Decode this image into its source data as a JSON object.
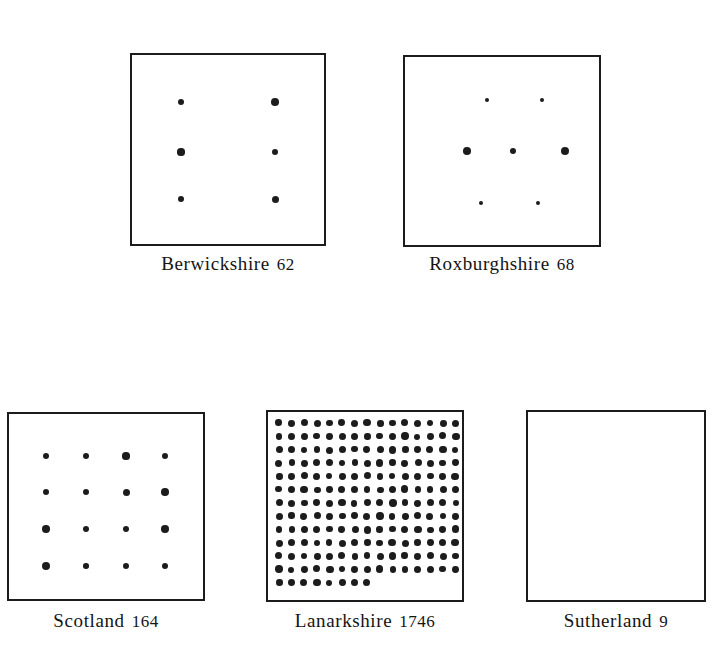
{
  "figure": {
    "background": "#ffffff",
    "ink_color": "#1c1c1c",
    "width": 718,
    "height": 663
  },
  "chart_data": {
    "type": "table",
    "title": "",
    "subtitle": "",
    "xlabel": "",
    "ylabel": "",
    "legend": [],
    "categories": [
      "Berwickshire",
      "Roxburghshire",
      "Scotland",
      "Lanarkshire",
      "Sutherland"
    ],
    "values": [
      62,
      68,
      164,
      1746,
      9
    ],
    "dots_drawn": [
      6,
      7,
      16,
      188,
      0
    ],
    "units": "",
    "grid": false
  },
  "panels": [
    {
      "id": "berwickshire",
      "name": "Berwickshire",
      "count": "62",
      "caption": "Berwickshire",
      "count_label": "62",
      "box": {
        "left": 130,
        "top": 53,
        "width": 196,
        "height": 193
      },
      "caption_top": 253,
      "dots": [
        {
          "x": 49,
          "y": 47,
          "r": 3.4
        },
        {
          "x": 143,
          "y": 47,
          "r": 3.8
        },
        {
          "x": 49,
          "y": 97,
          "r": 3.6
        },
        {
          "x": 143,
          "y": 97,
          "r": 3.4
        },
        {
          "x": 49,
          "y": 144,
          "r": 3.4
        },
        {
          "x": 143,
          "y": 144,
          "r": 3.5
        }
      ]
    },
    {
      "id": "roxburghshire",
      "name": "Roxburghshire",
      "count": "68",
      "caption": "Roxburghshire",
      "count_label": "68",
      "box": {
        "left": 403,
        "top": 55,
        "width": 198,
        "height": 192
      },
      "caption_top": 253,
      "dots": [
        {
          "x": 82,
          "y": 43,
          "r": 2.3
        },
        {
          "x": 137,
          "y": 43,
          "r": 2.2
        },
        {
          "x": 62,
          "y": 94,
          "r": 3.8
        },
        {
          "x": 108,
          "y": 94,
          "r": 3.2
        },
        {
          "x": 160,
          "y": 94,
          "r": 4.0
        },
        {
          "x": 76,
          "y": 146,
          "r": 2.2
        },
        {
          "x": 133,
          "y": 146,
          "r": 2.4
        }
      ]
    },
    {
      "id": "scotland",
      "name": "Scotland",
      "count": "164",
      "caption": "Scotland",
      "count_label": "164",
      "box": {
        "left": 7,
        "top": 412,
        "width": 198,
        "height": 189
      },
      "caption_top": 610,
      "dots": [
        {
          "x": 37,
          "y": 42,
          "r": 3.4
        },
        {
          "x": 77,
          "y": 42,
          "r": 3.3
        },
        {
          "x": 117,
          "y": 42,
          "r": 3.6
        },
        {
          "x": 156,
          "y": 42,
          "r": 3.3
        },
        {
          "x": 37,
          "y": 78,
          "r": 3.4
        },
        {
          "x": 77,
          "y": 78,
          "r": 3.3
        },
        {
          "x": 117,
          "y": 78,
          "r": 3.5
        },
        {
          "x": 156,
          "y": 78,
          "r": 3.8
        },
        {
          "x": 37,
          "y": 115,
          "r": 3.7
        },
        {
          "x": 77,
          "y": 115,
          "r": 3.4
        },
        {
          "x": 117,
          "y": 115,
          "r": 3.2
        },
        {
          "x": 156,
          "y": 115,
          "r": 3.7
        },
        {
          "x": 37,
          "y": 152,
          "r": 3.9
        },
        {
          "x": 77,
          "y": 152,
          "r": 2.8
        },
        {
          "x": 117,
          "y": 152,
          "r": 3.4
        },
        {
          "x": 156,
          "y": 152,
          "r": 3.0
        }
      ]
    },
    {
      "id": "lanarkshire",
      "name": "Lanarkshire",
      "count": "1746",
      "caption": "Lanarkshire",
      "count_label": "1746",
      "box": {
        "left": 266,
        "top": 410,
        "width": 198,
        "height": 192
      },
      "caption_top": 610,
      "grid": {
        "columns": 15,
        "rows": 13,
        "partial_last_row": 8,
        "start_x": 11,
        "start_y": 11,
        "step_x": 12.6,
        "step_y": 13.3,
        "radius": 3.4
      },
      "dots": []
    },
    {
      "id": "sutherland",
      "name": "Sutherland",
      "count": "9",
      "caption": "Sutherland",
      "count_label": "9",
      "box": {
        "left": 526,
        "top": 410,
        "width": 180,
        "height": 192
      },
      "caption_top": 610,
      "dots": []
    }
  ]
}
